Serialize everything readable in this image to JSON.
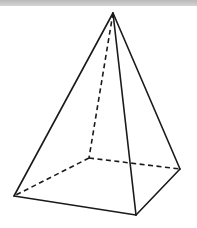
{
  "diagram": {
    "type": "3d-wireframe",
    "colors": {
      "stroke": "#1a1a1a",
      "background": "#ffffff",
      "top_bar": "#c4c4c4"
    },
    "vertices": {
      "apex": [
        113,
        13
      ],
      "front_left": [
        14,
        196
      ],
      "front_right": [
        136,
        215
      ],
      "back_right": [
        180,
        169
      ],
      "back_left": [
        89,
        158
      ]
    },
    "visible_edges": [
      [
        "apex",
        "front_left"
      ],
      [
        "apex",
        "front_right"
      ],
      [
        "apex",
        "back_right"
      ],
      [
        "front_left",
        "front_right"
      ],
      [
        "front_right",
        "back_right"
      ]
    ],
    "hidden_edges": [
      [
        "apex",
        "back_left"
      ],
      [
        "back_left",
        "front_left"
      ],
      [
        "back_left",
        "back_right"
      ]
    ]
  }
}
